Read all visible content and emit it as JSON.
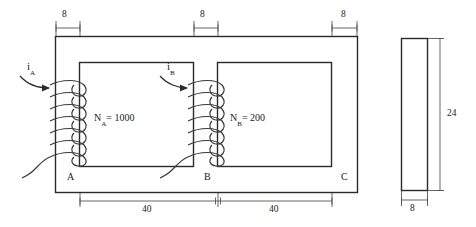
{
  "figure": {
    "type": "transformer-core-diagram",
    "stroke_color": "#2b2b2b",
    "background": "#ffffff"
  },
  "dimensions": {
    "top": [
      {
        "label": "8",
        "name": "left-limb-width"
      },
      {
        "label": "8",
        "name": "center-limb-width"
      },
      {
        "label": "8",
        "name": "right-limb-width"
      }
    ],
    "bottom": [
      {
        "label": "40",
        "name": "left-window-width"
      },
      {
        "label": "40",
        "name": "right-window-width"
      }
    ],
    "side": {
      "height": "24",
      "width": "8"
    }
  },
  "nodes": {
    "a": "A",
    "b": "B",
    "c": "C"
  },
  "currents": {
    "a": {
      "symbol": "i",
      "subscript": "A"
    },
    "b": {
      "symbol": "i",
      "subscript": "B"
    }
  },
  "windings": {
    "a": {
      "symbol": "N",
      "subscript": "A",
      "equals": "= 1000",
      "turns_drawn": 7
    },
    "b": {
      "symbol": "N",
      "subscript": "B",
      "equals": "= 200",
      "turns_drawn": 7
    }
  }
}
